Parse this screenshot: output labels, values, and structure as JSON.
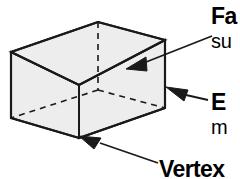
{
  "diagram": {
    "shape": {
      "name": "rectangular-prism",
      "fill_color": "#ededed",
      "stroke_color": "#1a1a1a",
      "hidden_edge_style": "dashed"
    },
    "background_color": "#ffffff",
    "text_color": "#000000"
  },
  "labels": {
    "face": {
      "heading": "Fa",
      "subtext": "su"
    },
    "edge": {
      "heading": "E",
      "subtext": "m"
    },
    "vertex": {
      "heading": "Vertex"
    }
  },
  "annotations": [
    {
      "id": "face-callout",
      "target": "top-face",
      "arrow": "arrow-left-down"
    },
    {
      "id": "edge-callout",
      "target": "vertical-edge",
      "arrow": "arrow-left-up"
    },
    {
      "id": "vertex-callout",
      "target": "front-bottom-vertex",
      "arrow": "arrow-left-up"
    }
  ]
}
